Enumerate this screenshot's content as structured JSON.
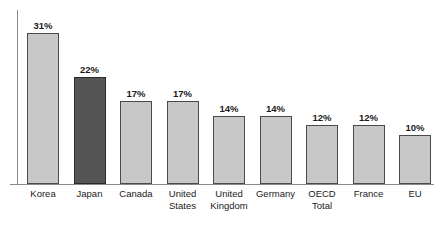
{
  "chart_data": {
    "type": "bar",
    "title": "",
    "subtitle": "",
    "xlabel": "",
    "ylabel": "",
    "ylim": [
      0,
      33
    ],
    "grid": false,
    "legend": "none",
    "orientation": "vertical",
    "value_suffix": "%",
    "sorted": "descending",
    "categories": [
      "Korea",
      "Japan",
      "Canada",
      "United States",
      "United Kingdom",
      "Germany",
      "OECD Total",
      "France",
      "EU"
    ],
    "values": [
      31,
      22,
      17,
      17,
      14,
      14,
      12,
      12,
      10
    ],
    "data_labels": [
      "31%",
      "22%",
      "17%",
      "17%",
      "14%",
      "14%",
      "12%",
      "12%",
      "10%"
    ],
    "highlight_index": 1,
    "colors": {
      "bar_fill": "#c8c8c8",
      "bar_stroke": "#4a4a4a",
      "highlight_fill": "#555555",
      "highlight_stroke": "#2b2b2b",
      "axis": "#8a8a8a",
      "text": "#1a1a1a",
      "background": "#ffffff"
    }
  },
  "bars": [
    {
      "category": "Korea",
      "label_lines": "Korea",
      "value": 31,
      "label": "31%",
      "highlight": false
    },
    {
      "category": "Japan",
      "label_lines": "Japan",
      "value": 22,
      "label": "22%",
      "highlight": true
    },
    {
      "category": "Canada",
      "label_lines": "Canada",
      "value": 17,
      "label": "17%",
      "highlight": false
    },
    {
      "category": "United States",
      "label_lines": "United\nStates",
      "value": 17,
      "label": "17%",
      "highlight": false
    },
    {
      "category": "United Kingdom",
      "label_lines": "United\nKingdom",
      "value": 14,
      "label": "14%",
      "highlight": false
    },
    {
      "category": "Germany",
      "label_lines": "Germany",
      "value": 14,
      "label": "14%",
      "highlight": false
    },
    {
      "category": "OECD Total",
      "label_lines": "OECD\nTotal",
      "value": 12,
      "label": "12%",
      "highlight": false
    },
    {
      "category": "France",
      "label_lines": "France",
      "value": 12,
      "label": "12%",
      "highlight": false
    },
    {
      "category": "EU",
      "label_lines": "EU",
      "value": 10,
      "label": "10%",
      "highlight": false
    }
  ]
}
